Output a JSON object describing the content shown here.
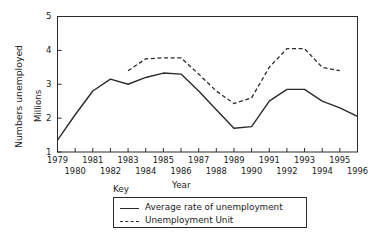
{
  "chart_data": {
    "type": "line",
    "title": "",
    "xlabel": "Year",
    "ylabel": "Numbers unemployed",
    "ylabel_secondary": "Millions",
    "xlim": [
      1979,
      1996
    ],
    "ylim": [
      1,
      5
    ],
    "yticks": [
      1,
      2,
      3,
      4,
      5
    ],
    "ytick_labels": [
      "1",
      "2",
      "3",
      "4",
      "5"
    ],
    "xticks": [
      1979,
      1980,
      1981,
      1982,
      1983,
      1984,
      1985,
      1986,
      1987,
      1988,
      1989,
      1990,
      1991,
      1992,
      1993,
      1994,
      1995,
      1996
    ],
    "xtick_labels_top": [
      "1979",
      "1981",
      "1983",
      "1985",
      "1987",
      "1989",
      "1991",
      "1993",
      "1995"
    ],
    "xtick_labels_bottom": [
      "1980",
      "1982",
      "1984",
      "1986",
      "1988",
      "1990",
      "1992",
      "1994",
      "1996"
    ],
    "grid": false,
    "legend_title": "Key",
    "legend_position": "below-axes",
    "series": [
      {
        "name": "Average rate of unemployment",
        "style": "solid",
        "color": "#2b2b2b",
        "x": [
          1979,
          1980,
          1981,
          1982,
          1983,
          1984,
          1985,
          1986,
          1987,
          1988,
          1989,
          1990,
          1991,
          1992,
          1993,
          1994,
          1995,
          1996
        ],
        "values": [
          1.35,
          2.1,
          2.8,
          3.15,
          3.0,
          3.2,
          3.33,
          3.3,
          2.8,
          2.25,
          1.7,
          1.75,
          2.5,
          2.85,
          2.85,
          2.5,
          2.3,
          2.05
        ]
      },
      {
        "name": "Unemployment Unit",
        "style": "dashed",
        "color": "#2b2b2b",
        "x": [
          1983,
          1984,
          1985,
          1986,
          1987,
          1988,
          1989,
          1990,
          1991,
          1992,
          1993,
          1994,
          1995
        ],
        "values": [
          3.4,
          3.75,
          3.78,
          3.78,
          3.3,
          2.8,
          2.43,
          2.6,
          3.5,
          4.05,
          4.05,
          3.5,
          3.4
        ]
      }
    ]
  },
  "axis_titles": {
    "y_outer": "Numbers unemployed",
    "y_inner": "Millions",
    "x": "Year"
  },
  "legend": {
    "title": "Key",
    "items": [
      {
        "label": "Average rate of unemployment",
        "style": "solid"
      },
      {
        "label": "Unemployment Unit",
        "style": "dashed"
      }
    ]
  },
  "caption": ""
}
